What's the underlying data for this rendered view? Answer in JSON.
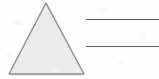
{
  "image": {
    "title": "Triangle with two blank answer lines",
    "width": 159,
    "height": 79,
    "background_color": "#fefefe"
  },
  "shapes": {
    "triangle": {
      "name": "triangle",
      "type": "isosceles-triangle",
      "fill_color": "#ebebeb",
      "stroke_color": "#8a8a8a",
      "stroke_width": 1.4,
      "apex": {
        "x": 46,
        "y": 3
      },
      "bottom_left": {
        "x": 9,
        "y": 74
      },
      "bottom_right": {
        "x": 84,
        "y": 74
      },
      "points": "46,3 84,74 9,74"
    }
  },
  "rules": {
    "color": "#5a5a5a",
    "stroke_width": 1.2,
    "lines": [
      {
        "name": "answer-line-1",
        "x1": 86,
        "y1": 19.5,
        "x2": 159,
        "y2": 19.5
      },
      {
        "name": "answer-line-2",
        "x1": 86,
        "y1": 46.5,
        "x2": 159,
        "y2": 46.5
      }
    ]
  },
  "labels": {
    "triangle_label": "",
    "line_1_label": "",
    "line_2_label": ""
  }
}
